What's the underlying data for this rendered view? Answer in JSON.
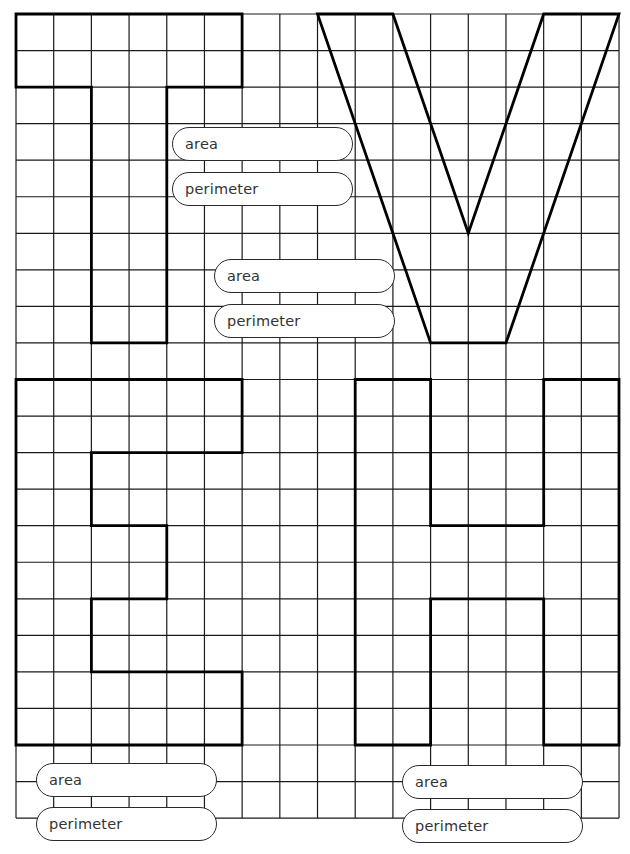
{
  "worksheet": {
    "grid": {
      "origin_x": 16,
      "origin_y": 14,
      "cols": 16,
      "rows": 22,
      "cell_w": 37.69,
      "cell_h": 36.55,
      "line_color": "#1a1a1a",
      "shape_color": "#000000"
    },
    "shapes": [
      {
        "letter": "T",
        "points": [
          [
            0,
            0
          ],
          [
            6,
            0
          ],
          [
            6,
            2
          ],
          [
            4,
            2
          ],
          [
            4,
            9
          ],
          [
            2,
            9
          ],
          [
            2,
            2
          ],
          [
            0,
            2
          ]
        ]
      },
      {
        "letter": "V",
        "points": [
          [
            8,
            0
          ],
          [
            10,
            0
          ],
          [
            12,
            6
          ],
          [
            14,
            0
          ],
          [
            16,
            0
          ],
          [
            13,
            9
          ],
          [
            11,
            9
          ]
        ]
      },
      {
        "letter": "E",
        "points": [
          [
            0,
            10
          ],
          [
            6,
            10
          ],
          [
            6,
            12
          ],
          [
            2,
            12
          ],
          [
            2,
            14
          ],
          [
            4,
            14
          ],
          [
            4,
            16
          ],
          [
            2,
            16
          ],
          [
            2,
            18
          ],
          [
            6,
            18
          ],
          [
            6,
            20
          ],
          [
            0,
            20
          ]
        ]
      },
      {
        "letter": "H",
        "points": [
          [
            9,
            10
          ],
          [
            11,
            10
          ],
          [
            11,
            14
          ],
          [
            14,
            14
          ],
          [
            14,
            10
          ],
          [
            16,
            10
          ],
          [
            16,
            20
          ],
          [
            14,
            20
          ],
          [
            14,
            16
          ],
          [
            11,
            16
          ],
          [
            11,
            20
          ],
          [
            9,
            20
          ]
        ]
      }
    ],
    "answer_fields": [
      {
        "shape": "T",
        "label": "area",
        "x": 172,
        "y": 127
      },
      {
        "shape": "T",
        "label": "perimeter",
        "x": 172,
        "y": 172
      },
      {
        "shape": "V",
        "label": "area",
        "x": 214,
        "y": 259
      },
      {
        "shape": "V",
        "label": "perimeter",
        "x": 214,
        "y": 304
      },
      {
        "shape": "E",
        "label": "area",
        "x": 36,
        "y": 763
      },
      {
        "shape": "E",
        "label": "perimeter",
        "x": 36,
        "y": 807
      },
      {
        "shape": "H",
        "label": "area",
        "x": 402,
        "y": 765
      },
      {
        "shape": "H",
        "label": "perimeter",
        "x": 402,
        "y": 809
      }
    ],
    "labels": {
      "t_area": "area",
      "t_perimeter": "perimeter",
      "v_area": "area",
      "v_perimeter": "perimeter",
      "e_area": "area",
      "e_perimeter": "perimeter",
      "h_area": "area",
      "h_perimeter": "perimeter"
    }
  }
}
